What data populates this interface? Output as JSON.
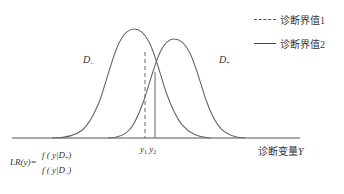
{
  "curves": {
    "negative_label": "D",
    "negative_sub": "−",
    "positive_label": "D",
    "positive_sub": "+"
  },
  "legend": {
    "items": [
      {
        "label": "诊断界值1",
        "style": "dashed"
      },
      {
        "label": "诊断界值2",
        "style": "solid"
      }
    ]
  },
  "axis": {
    "label": "诊断变量",
    "var": "Y"
  },
  "cutoffs": {
    "y1": "y",
    "y1_sub": "1",
    "y2": "y",
    "y2_sub": "2"
  },
  "formula": {
    "lhs": "LR(y)=",
    "numerator": "f ( y|D",
    "numerator_sub": "+",
    "denominator": "f ( y|D",
    "denominator_sub": "−",
    "close": ")"
  },
  "colors": {
    "line": "#555555",
    "text": "#333333"
  }
}
